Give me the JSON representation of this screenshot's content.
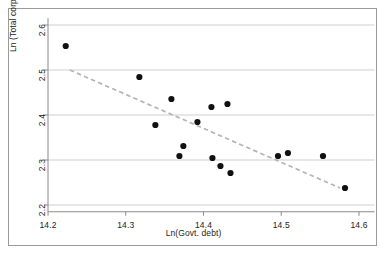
{
  "chart_data": {
    "type": "scatter",
    "title": "",
    "xlabel": "Ln(Govt. debt)",
    "ylabel": "Ln (Total corporate debt)",
    "xlim": [
      14.17,
      14.62
    ],
    "ylim": [
      2.185,
      2.615
    ],
    "xticks": [
      "14.2",
      "14.3",
      "14.4",
      "14.5",
      "14.6"
    ],
    "xtick_values": [
      14.2,
      14.3,
      14.4,
      14.5,
      14.6
    ],
    "yticks": [
      "2.2",
      "2.3",
      "2.4",
      "2.5",
      "2.6"
    ],
    "ytick_values": [
      2.2,
      2.3,
      2.4,
      2.5,
      2.6
    ],
    "grid": "horizontal",
    "legend": "none",
    "marker_color": "#111111",
    "grid_color": "#c9c9c9",
    "axis_color": "#8a8a8a",
    "trendline_color": "#b4b4b4",
    "points": [
      {
        "x": 14.2228,
        "y": 2.5533
      },
      {
        "x": 14.3175,
        "y": 2.4844
      },
      {
        "x": 14.3587,
        "y": 2.4356
      },
      {
        "x": 14.3381,
        "y": 2.3778
      },
      {
        "x": 14.3741,
        "y": 2.3311
      },
      {
        "x": 14.369,
        "y": 2.3089
      },
      {
        "x": 14.3922,
        "y": 2.3844
      },
      {
        "x": 14.4102,
        "y": 2.4178
      },
      {
        "x": 14.4308,
        "y": 2.4244
      },
      {
        "x": 14.4115,
        "y": 2.3044
      },
      {
        "x": 14.4218,
        "y": 2.2867
      },
      {
        "x": 14.4347,
        "y": 2.2711
      },
      {
        "x": 14.4958,
        "y": 2.3089
      },
      {
        "x": 14.5086,
        "y": 2.3156
      },
      {
        "x": 14.5537,
        "y": 2.3089
      },
      {
        "x": 14.582,
        "y": 2.2378
      }
    ],
    "trendline": {
      "style": "dashed",
      "x_start": 14.228,
      "y_start": 2.5,
      "x_end": 14.5756,
      "y_end": 2.2378
    }
  }
}
